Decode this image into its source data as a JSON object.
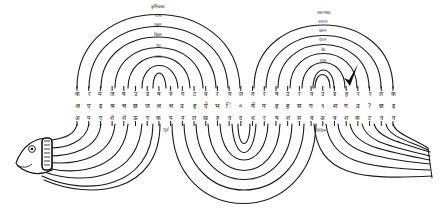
{
  "diagram": {
    "left_arch_labels": [
      "कृत्तिकाद्य",
      "पञ्च",
      "एकम",
      "विहस",
      "पंच",
      "सप्त"
    ],
    "right_arch_labels": [
      "उत्तराषाढ",
      "पञ्चम",
      "दशम",
      "पंचम",
      "वेद",
      "सप्त"
    ],
    "lower_labels": {
      "left": "पूर्व",
      "right": "पश्चिम"
    },
    "row_top": [
      "क",
      "र",
      "म",
      "ज",
      "ष",
      "उ",
      "ड",
      "ष",
      "रु",
      "ग",
      "ट",
      "ब",
      "र",
      "य",
      "ल",
      "त",
      "र",
      "ष",
      "उ",
      "र",
      "व",
      "उ",
      "ड",
      "ह",
      "र",
      "र",
      "ल",
      "क"
    ],
    "row_middle": [
      "अ",
      "ए",
      "इ",
      "श्र",
      "च",
      "छ",
      "ज",
      "अ",
      "थ",
      "उ",
      "ह",
      "ऐ",
      "भ",
      "ि",
      "०",
      "ये",
      "प",
      "ह",
      "ह",
      "स",
      "ग",
      "९",
      "श",
      "ग",
      "उ",
      "?",
      "छ",
      "इ"
    ],
    "row_bottom": [
      "अ",
      "प",
      "ए",
      "शे",
      "शे",
      "ऊ",
      "ए",
      "क",
      "प",
      "न",
      "ल",
      "ख",
      "ह",
      "व",
      "द",
      "ध",
      "र",
      "ष",
      "श",
      "स",
      "ब",
      "अ",
      "ब",
      "श",
      "क",
      "ट",
      "व",
      "व"
    ],
    "colors": {
      "ink": "#1a1a1a",
      "paper": "#ffffff"
    }
  }
}
